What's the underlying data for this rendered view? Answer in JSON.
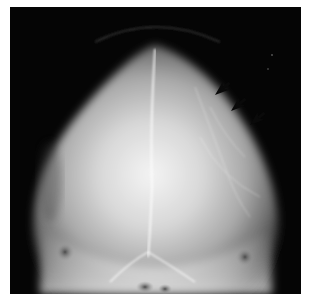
{
  "image": {
    "subject": "skull radiograph (frontal view)",
    "background_color": "#050505",
    "border_color": "#ffffff",
    "annotations": [
      {
        "type": "arrow",
        "direction": "down-left",
        "color": "#000000",
        "x": 215,
        "y": 90
      },
      {
        "type": "arrow",
        "direction": "down-left",
        "color": "#000000",
        "x": 230,
        "y": 104
      },
      {
        "type": "arrow",
        "direction": "down-left",
        "color": "#000000",
        "x": 248,
        "y": 118
      }
    ]
  }
}
